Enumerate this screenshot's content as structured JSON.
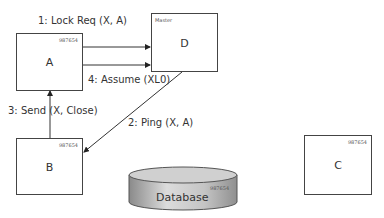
{
  "nodes": {
    "A": {
      "label": "A",
      "id": "987654"
    },
    "B": {
      "label": "B",
      "id": "987654"
    },
    "C": {
      "label": "C",
      "id": "987654"
    },
    "D": {
      "label": "D",
      "tag": "Master"
    },
    "db": {
      "label": "Database",
      "id": "987654"
    }
  },
  "edges": [
    {
      "label": "1: Lock Req (X, A)",
      "from": "A",
      "to": "D"
    },
    {
      "label": "2: Ping (X, A)",
      "from": "D",
      "to": "B"
    },
    {
      "label": "3: Send (X, Close)",
      "from": "B",
      "to": "A"
    },
    {
      "label": "4: Assume (XL0)",
      "from": "A",
      "to": "D"
    }
  ]
}
